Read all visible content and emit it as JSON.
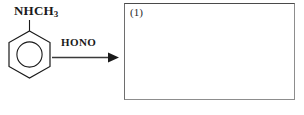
{
  "diagram": {
    "type": "organic-reaction-scheme",
    "reactant": {
      "structure_name": "benzene-ring",
      "substituent_label": "NHCH",
      "substituent_subscript": "3",
      "full_label": "NHCH3"
    },
    "arrow": {
      "reagent_label": "HONO",
      "direction": "right"
    },
    "product": {
      "answer_box_label": "(1)",
      "content": ""
    },
    "colors": {
      "stroke": "#1a1a1a",
      "box_border": "#8d8d8d",
      "box_border_top": "#4a4a4a",
      "background": "#ffffff"
    }
  }
}
